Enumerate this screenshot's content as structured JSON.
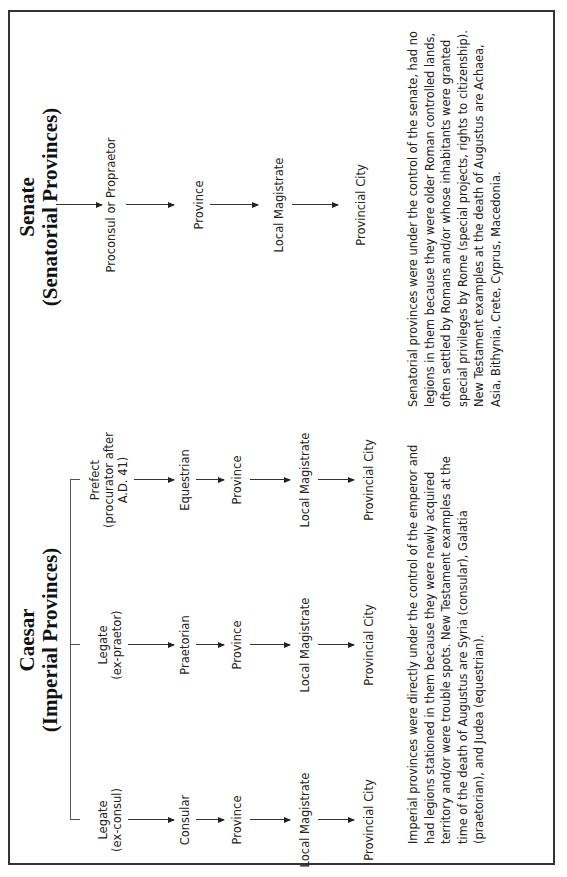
{
  "imperial": {
    "heading_line1": "Caesar",
    "heading_line2": "(Imperial Provinces)",
    "columns": [
      {
        "office_line1": "Legate",
        "office_line2": "(ex-consul)",
        "rank": "Consular",
        "unit": "Province",
        "local": "Local Magistrate",
        "city": "Provincial City"
      },
      {
        "office_line1": "Legate",
        "office_line2": "(ex-praetor)",
        "rank": "Praetorian",
        "unit": "Province",
        "local": "Local Magistrate",
        "city": "Provincial City"
      },
      {
        "office_line1": "Prefect",
        "office_line2": "(procurator after",
        "office_line3": "A.D. 41)",
        "rank": "Equestrian",
        "unit": "Province",
        "local": "Local Magistrate",
        "city": "Provincial City"
      }
    ],
    "description": "Imperial provinces were directly under the control of the emperor and had legions stationed in them because they were newly acquired territory and/or were trouble spots. New Testament examples at the time of the death of Augustus are Syria (consular), Galatia (praetorian), and Judea (equestrian)."
  },
  "senatorial": {
    "heading_line1": "Senate",
    "heading_line2": "(Senatorial Provinces)",
    "chain": {
      "office": "Proconsul or Propraetor",
      "unit": "Province",
      "local": "Local Magistrate",
      "city": "Provincial City"
    },
    "description": "Senatorial provinces were under the control of the senate, had no legions in them because they were older Roman controlled lands, often settled by Romans and/or whose inhabitants were granted special privileges by Rome (special projects, rights to citizenship). New Testament examples at the death of Augustus are Achaea, Asia, Bithynia, Crete, Cyprus, Macedonia."
  },
  "colors": {
    "border": "#333333",
    "text": "#222222",
    "background": "#ffffff"
  }
}
